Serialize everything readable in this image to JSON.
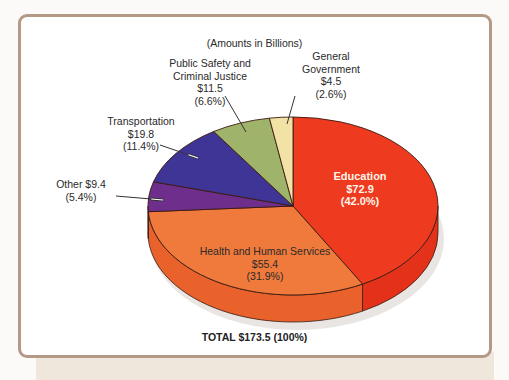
{
  "chart_data": {
    "type": "pie",
    "style": "3d-exploded-ellipse",
    "title": "",
    "subtitle": "(Amounts in Billions)",
    "unit": "billions USD",
    "total_label": "TOTAL $173.5 (100%)",
    "total": 173.5,
    "slices": [
      {
        "name": "Education",
        "value": 72.9,
        "percent": 42.0,
        "color": "#ee3a1f",
        "side_color": "#e4321a",
        "amount_label": "$72.9",
        "percent_label": "(42.0%)"
      },
      {
        "name": "Health and Human Services",
        "value": 55.4,
        "percent": 31.9,
        "color": "#f07a3c",
        "side_color": "#e9612b",
        "amount_label": "$55.4",
        "percent_label": "(31.9%)"
      },
      {
        "name": "Other",
        "value": 9.4,
        "percent": 5.4,
        "color": "#6e2f8c",
        "side_color": "#5a2475",
        "amount_label": "$9.4",
        "percent_label": "(5.4%)"
      },
      {
        "name": "Transportation",
        "value": 19.8,
        "percent": 11.4,
        "color": "#3f3597",
        "side_color": "#34297f",
        "amount_label": "$19.8",
        "percent_label": "(11.4%)"
      },
      {
        "name": "Public Safety and Criminal Justice",
        "value": 11.5,
        "percent": 6.6,
        "color": "#9fb46a",
        "side_color": "#869a56",
        "amount_label": "$11.5",
        "percent_label": "(6.6%)"
      },
      {
        "name": "General Government",
        "value": 4.5,
        "percent": 2.6,
        "color": "#f3e2a6",
        "side_color": "#dccb8c",
        "amount_label": "$4.5",
        "percent_label": "(2.6%)"
      }
    ]
  },
  "labels": {
    "subtitle": "(Amounts in Billions)",
    "education": {
      "name": "Education",
      "amount": "$72.9",
      "percent": "(42.0%)"
    },
    "health": {
      "name": "Health and Human Services",
      "amount": "$55.4",
      "percent": "(31.9%)"
    },
    "other": {
      "line1": "Other $9.4",
      "percent": "(5.4%)"
    },
    "transportation": {
      "name": "Transportation",
      "amount": "$19.8",
      "percent": "(11.4%)"
    },
    "public_safety": {
      "line1": "Public Safety and",
      "line2": "Criminal Justice",
      "amount": "$11.5",
      "percent": "(6.6%)"
    },
    "general_government": {
      "line1": "General",
      "line2": "Government",
      "amount": "$4.5",
      "percent": "(2.6%)"
    },
    "total": "TOTAL $173.5 (100%)"
  },
  "colors": {
    "frame_border": "#b49a86",
    "background": "#fbfaf8",
    "outline": "#3a1a10"
  }
}
